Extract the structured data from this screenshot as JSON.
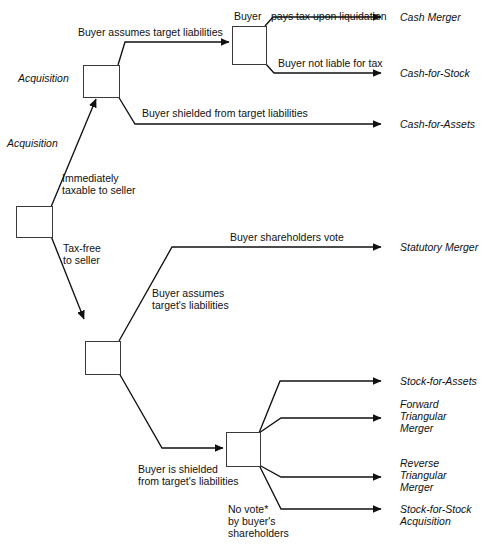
{
  "diagram": {
    "type": "decision-tree",
    "stroke_color": "#111111",
    "node_border_color": "#3a3a3a",
    "background": "#ffffff",
    "nodes": [
      {
        "id": "root",
        "name": "root-decision-node",
        "x": 16,
        "y": 206,
        "w": 35,
        "h": 30
      },
      {
        "id": "acq_taxable",
        "name": "taxable-acquisition-node",
        "x": 83,
        "y": 65,
        "w": 35,
        "h": 31
      },
      {
        "id": "buyer",
        "name": "buyer-tax-node",
        "x": 232,
        "y": 26,
        "w": 33,
        "h": 37
      },
      {
        "id": "taxfree",
        "name": "taxfree-acquisition-node",
        "x": 85,
        "y": 341,
        "w": 34,
        "h": 32
      },
      {
        "id": "shielded",
        "name": "shielded-liabilities-node",
        "x": 226,
        "y": 432,
        "w": 33,
        "h": 33
      }
    ],
    "edge_labels": [
      {
        "id": "acq_top",
        "text": "Acquisition",
        "x": 18,
        "y": 72,
        "italic": true,
        "align": "left"
      },
      {
        "id": "acq_bottom",
        "text": "Acquisition",
        "x": 7,
        "y": 137,
        "italic": true,
        "align": "left"
      },
      {
        "id": "assumes_liab",
        "text": "Buyer assumes target liabilities",
        "x": 78,
        "y": 26,
        "italic": false,
        "align": "left"
      },
      {
        "id": "buyer_node_lbl",
        "text": "Buyer",
        "x": 234,
        "y": 10,
        "italic": false,
        "align": "left"
      },
      {
        "id": "pays_tax",
        "text": "pays tax upon liquidation",
        "x": 271,
        "y": 10,
        "italic": false,
        "align": "left"
      },
      {
        "id": "not_liable",
        "text": "Buyer not liable for tax",
        "x": 278,
        "y": 57,
        "italic": false,
        "align": "left"
      },
      {
        "id": "shielded_top",
        "text": "Buyer shielded from target liabilities",
        "x": 142,
        "y": 107,
        "italic": false,
        "align": "left"
      },
      {
        "id": "immediately",
        "text": "Immediately\ntaxable to seller",
        "x": 62,
        "y": 172,
        "italic": false,
        "align": "left"
      },
      {
        "id": "taxfree_lbl",
        "text": "Tax-free\nto seller",
        "x": 63,
        "y": 242,
        "italic": false,
        "align": "left"
      },
      {
        "id": "bsh_vote",
        "text": "Buyer shareholders vote",
        "x": 230,
        "y": 231,
        "italic": false,
        "align": "left"
      },
      {
        "id": "assumes_tgt",
        "text": "Buyer assumes\ntarget's liabilities",
        "x": 152,
        "y": 287,
        "italic": false,
        "align": "left"
      },
      {
        "id": "shielded_bot",
        "text": "Buyer is shielded\nfrom target's liabilities",
        "x": 138,
        "y": 463,
        "italic": false,
        "align": "left"
      },
      {
        "id": "no_vote",
        "text": "No vote*\nby buyer's\nshareholders",
        "x": 228,
        "y": 503,
        "italic": false,
        "align": "left"
      }
    ],
    "outcomes": [
      {
        "id": "cash_merger",
        "name": "outcome-cash-merger",
        "text": "Cash Merger",
        "x": 400,
        "y": 11,
        "arrow_y": 17
      },
      {
        "id": "cash_for_stock",
        "name": "outcome-cash-for-stock",
        "text": "Cash-for-Stock",
        "x": 400,
        "y": 67,
        "arrow_y": 73
      },
      {
        "id": "cash_for_assets",
        "name": "outcome-cash-for-assets",
        "text": "Cash-for-Assets",
        "x": 400,
        "y": 118,
        "arrow_y": 124
      },
      {
        "id": "statutory_merger",
        "name": "outcome-statutory-merger",
        "text": "Statutory Merger",
        "x": 400,
        "y": 241,
        "arrow_y": 247
      },
      {
        "id": "stock_for_assets",
        "name": "outcome-stock-for-assets",
        "text": "Stock-for-Assets",
        "x": 400,
        "y": 375,
        "arrow_y": 381
      },
      {
        "id": "fwd_tri_merger",
        "name": "outcome-forward-triangular-merger",
        "text": "Forward\nTriangular\nMerger",
        "x": 400,
        "y": 398,
        "arrow_y": 418
      },
      {
        "id": "rev_tri_merger",
        "name": "outcome-reverse-triangular-merger",
        "text": "Reverse\nTriangular\nMerger",
        "x": 400,
        "y": 457,
        "arrow_y": 477
      },
      {
        "id": "stock_for_stock",
        "name": "outcome-stock-for-stock-acquisition",
        "text": "Stock-for-Stock\nAcquisition",
        "x": 400,
        "y": 503,
        "arrow_y": 509
      }
    ],
    "footnote_marker": "*"
  }
}
